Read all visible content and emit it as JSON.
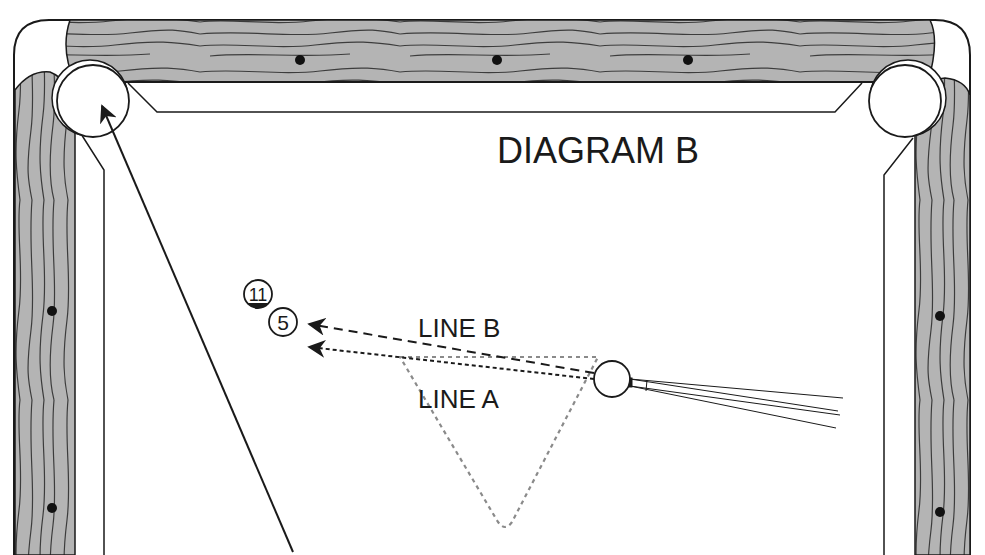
{
  "diagram": {
    "title": "DIAGRAM B",
    "colors": {
      "background": "#ffffff",
      "ink": "#1a1a1a",
      "wood": "#b4b4b4",
      "wood_grain": "#3c3c3c",
      "diamond": "#111111",
      "guide_gray": "#8a8a8a"
    },
    "table": {
      "rails": [
        "top",
        "left",
        "right"
      ],
      "pockets": [
        {
          "id": "top-left-corner",
          "cx": 93,
          "cy": 100,
          "r": 37
        },
        {
          "id": "top-right-corner",
          "cx": 905,
          "cy": 100,
          "r": 37
        }
      ],
      "diamonds": {
        "top": [
          [
            300,
            60
          ],
          [
            497,
            60
          ],
          [
            688,
            60
          ]
        ],
        "left": [
          [
            52,
            311
          ],
          [
            52,
            508
          ]
        ],
        "right": [
          [
            940,
            316
          ],
          [
            940,
            512
          ]
        ]
      }
    },
    "balls": [
      {
        "number": "11",
        "type": "stripe",
        "cx": 258,
        "cy": 294,
        "r": 14
      },
      {
        "number": "5",
        "type": "solid",
        "cx": 283,
        "cy": 322,
        "r": 14
      },
      {
        "number": "",
        "type": "cue-ball",
        "cx": 612,
        "cy": 378,
        "r": 18
      }
    ],
    "lines": [
      {
        "label": "LINE B",
        "style": "dashed",
        "from": [
          594,
          373
        ],
        "to": [
          305,
          324
        ]
      },
      {
        "label": "LINE A",
        "style": "dotted",
        "from": [
          594,
          378
        ],
        "to": [
          305,
          347
        ]
      },
      {
        "label": "object-ball-path",
        "style": "solid",
        "from": [
          293,
          552
        ],
        "to": [
          97,
          100
        ]
      }
    ],
    "labels": {
      "line_b": "LINE B",
      "line_a": "LINE A"
    },
    "guide_triangle": {
      "points": [
        [
          400,
          357
        ],
        [
          600,
          357
        ],
        [
          505,
          530
        ]
      ],
      "style": "gray-dotted"
    }
  }
}
